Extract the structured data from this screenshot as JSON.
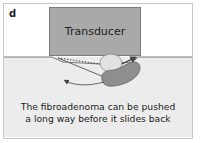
{
  "figure": {
    "panel_label": "d",
    "transducer_label": "Transducer",
    "caption_line1": "The fibroadenoma can be pushed",
    "caption_line2": "a long way before it slides back"
  },
  "colors": {
    "transducer_fill": "#a9a9a9",
    "tissue_fill": "#ececec",
    "lesion_original": "#e2e2e2",
    "lesion_displaced": "#8e8e8e",
    "arrow": "#555555"
  }
}
